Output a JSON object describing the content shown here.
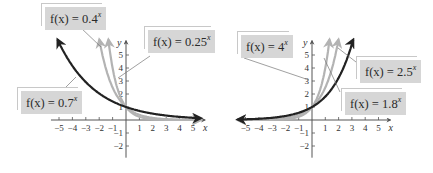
{
  "chart_data": [
    {
      "type": "line",
      "title": "",
      "xlabel": "x",
      "ylabel": "y",
      "xlim": [
        -5.5,
        5.5
      ],
      "ylim": [
        -2.5,
        6
      ],
      "x_ticks": [
        -5,
        -4,
        -3,
        -2,
        -1,
        1,
        2,
        3,
        4,
        5
      ],
      "y_ticks": [
        -2,
        -1,
        1,
        2,
        3,
        4,
        5
      ],
      "grid": false,
      "series": [
        {
          "name": "f(x) = 0.7^x",
          "base": 0.7,
          "color": "#222222",
          "label": "f(x) = 0.7",
          "exp": "x"
        },
        {
          "name": "f(x) = 0.4^x",
          "base": 0.4,
          "color": "#b3b3b3",
          "label": "f(x) = 0.4",
          "exp": "x"
        },
        {
          "name": "f(x) = 0.25^x",
          "base": 0.25,
          "color": "#b3b3b3",
          "label": "f(x) = 0.25",
          "exp": "x"
        }
      ]
    },
    {
      "type": "line",
      "title": "",
      "xlabel": "x",
      "ylabel": "y",
      "xlim": [
        -5.5,
        5.5
      ],
      "ylim": [
        -2.5,
        6
      ],
      "x_ticks": [
        -5,
        -4,
        -3,
        -2,
        -1,
        1,
        2,
        3,
        4,
        5
      ],
      "y_ticks": [
        -2,
        -1,
        1,
        2,
        3,
        4,
        5
      ],
      "grid": false,
      "series": [
        {
          "name": "f(x) = 4^x",
          "base": 4,
          "color": "#b3b3b3",
          "label": "f(x) = 4",
          "exp": "x"
        },
        {
          "name": "f(x) = 2.5^x",
          "base": 2.5,
          "color": "#b3b3b3",
          "label": "f(x) = 2.5",
          "exp": "x"
        },
        {
          "name": "f(x) = 1.8^x",
          "base": 1.8,
          "color": "#222222",
          "label": "f(x) = 1.8",
          "exp": "x"
        }
      ]
    }
  ],
  "labels": {
    "left_04": {
      "prefix": "f(x) = 0.4",
      "exp": "x"
    },
    "left_025": {
      "prefix": "f(x) = 0.25",
      "exp": "x"
    },
    "left_07": {
      "prefix": "f(x) = 0.7",
      "exp": "x"
    },
    "right_4": {
      "prefix": "f(x) = 4",
      "exp": "x"
    },
    "right_25": {
      "prefix": "f(x) = 2.5",
      "exp": "x"
    },
    "right_18": {
      "prefix": "f(x) = 1.8",
      "exp": "x"
    }
  },
  "axis": {
    "x_label": "x",
    "y_label": "y"
  }
}
